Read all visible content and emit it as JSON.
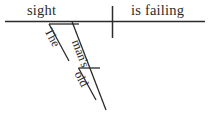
{
  "diagram": {
    "kind": "reed-kellogg-sentence-diagram",
    "sentence": "The old man's sight is failing",
    "ink_color": "#2b2b2b",
    "background_color": "#ffffff",
    "baseline": {
      "subject": "sight",
      "predicate": "is failing"
    },
    "modifiers": [
      {
        "word": "The",
        "role": "article"
      },
      {
        "word": "man's",
        "role": "possessive"
      },
      {
        "word": "old",
        "role": "adjective"
      }
    ],
    "lines": {
      "baseline_label": "horizontal-baseline",
      "divider_label": "subject-predicate-divider",
      "article_slant_label": "article-slant-line",
      "possessive_slant_label": "possessive-slant-line",
      "adjective_slant_label": "adjective-slant-line"
    }
  }
}
